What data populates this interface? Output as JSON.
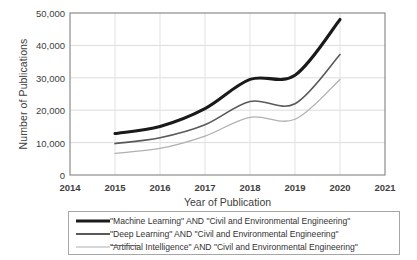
{
  "chart_data": {
    "type": "line",
    "title": "",
    "xlabel": "Year of Publication",
    "ylabel": "Number of Publications",
    "xlim": [
      2014,
      2021
    ],
    "ylim": [
      0,
      50000
    ],
    "grid": true,
    "legend_position": "bottom",
    "x": [
      2015,
      2016,
      2017,
      2018,
      2019,
      2020
    ],
    "xticks": [
      "2014",
      "2015",
      "2016",
      "2017",
      "2018",
      "2019",
      "2020",
      "2021"
    ],
    "yticks": [
      "0",
      "10,000",
      "20,000",
      "30,000",
      "40,000",
      "50,000"
    ],
    "series": [
      {
        "name": "\"Machine Learning\" AND  \"Civil and Environmental Engineering\"",
        "color": "#1a1a1a",
        "width": 3.1,
        "values": [
          12800,
          15000,
          20500,
          29500,
          30800,
          48000
        ]
      },
      {
        "name": "\"Deep Learning\" AND \"Civil and Environmental Engineering\"",
        "color": "#595959",
        "width": 1.6,
        "values": [
          9700,
          11500,
          15500,
          22700,
          22000,
          37200
        ]
      },
      {
        "name": "\"Artificial Intelligence\" AND \"Civil and Environmental Engineering\"",
        "color": "#b0b0b0",
        "width": 1.3,
        "values": [
          6700,
          8200,
          12000,
          17800,
          17200,
          29500
        ]
      }
    ]
  },
  "axes": {
    "ylabel": "Number of Publications",
    "xlabel": "Year of Publication",
    "yticks": [
      "50,000",
      "40,000",
      "30,000",
      "20,000",
      "10,000",
      "0"
    ],
    "xticks": [
      "2014",
      "2015",
      "2016",
      "2017",
      "2018",
      "2019",
      "2020",
      "2021"
    ]
  },
  "legend": {
    "items": [
      {
        "label": "\"Machine Learning\" AND  \"Civil and Environmental Engineering\"",
        "color": "#1a1a1a"
      },
      {
        "label": "\"Deep Learning\" AND \"Civil and Environmental Engineering\"",
        "color": "#595959"
      },
      {
        "label": "\"Artificial Intelligence\" AND \"Civil and Environmental Engineering\"",
        "color": "#b0b0b0"
      }
    ]
  },
  "colors": {
    "machine_learning": "#1a1a1a",
    "deep_learning": "#595959",
    "artificial_intelligence": "#b0b0b0",
    "grid": "#d9d9d9",
    "frame": "#808080"
  }
}
